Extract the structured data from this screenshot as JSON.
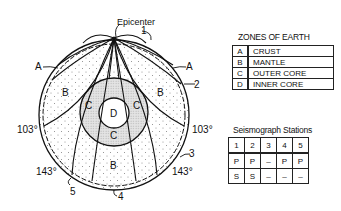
{
  "diagram": {
    "epicenter_label": "Epicenter",
    "zone_labels": {
      "crust_left": "A",
      "crust_right": "A",
      "mantle_left": "B",
      "mantle_right": "B",
      "mantle_bottom": "B",
      "outer_core_left": "C",
      "outer_core_right": "C",
      "outer_core_bottom": "C",
      "inner_core": "D"
    },
    "angle_labels": {
      "left_103": "103°",
      "right_103": "103°",
      "left_143": "143°",
      "right_143": "143°"
    },
    "station_markers": [
      "1",
      "2",
      "3",
      "4",
      "5"
    ]
  },
  "zones_table": {
    "title": "ZONES OF EARTH",
    "rows": [
      {
        "key": "A",
        "value": "CRUST"
      },
      {
        "key": "B",
        "value": "MANTLE"
      },
      {
        "key": "C",
        "value": "OUTER CORE"
      },
      {
        "key": "D",
        "value": "INNER CORE"
      }
    ]
  },
  "stations_table": {
    "title": "Seismograph Stations",
    "header": [
      "1",
      "2",
      "3",
      "4",
      "5"
    ],
    "rows": [
      [
        "P",
        "P",
        "–",
        "P",
        "P"
      ],
      [
        "S",
        "S",
        "–",
        "–",
        "–"
      ]
    ]
  }
}
